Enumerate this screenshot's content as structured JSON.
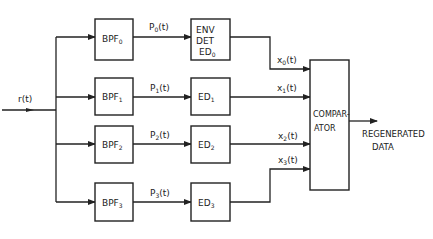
{
  "input": {
    "label": "r(t)"
  },
  "branches": [
    {
      "bpf": "BPF",
      "bpf_sub": "0",
      "signal": "P",
      "signal_sub": "0",
      "signal_arg": "(t)",
      "det_lines": [
        "ENV",
        "DET",
        "ED"
      ],
      "det_sub": "0",
      "out": "x",
      "out_sub": "0",
      "out_arg": "(t)"
    },
    {
      "bpf": "BPF",
      "bpf_sub": "1",
      "signal": "P",
      "signal_sub": "1",
      "signal_arg": "(t)",
      "det_lines": [
        "ED"
      ],
      "det_sub": "1",
      "out": "x",
      "out_sub": "1",
      "out_arg": "(t)"
    },
    {
      "bpf": "BPF",
      "bpf_sub": "2",
      "signal": "P",
      "signal_sub": "2",
      "signal_arg": "(t)",
      "det_lines": [
        "ED"
      ],
      "det_sub": "2",
      "out": "x",
      "out_sub": "2",
      "out_arg": "(t)"
    },
    {
      "bpf": "BPF",
      "bpf_sub": "3",
      "signal": "P",
      "signal_sub": "3",
      "signal_arg": "(t)",
      "det_lines": [
        "ED"
      ],
      "det_sub": "3",
      "out": "x",
      "out_sub": "3",
      "out_arg": "(t)"
    }
  ],
  "comparator": {
    "line1": "COMPAR-",
    "line2": "ATOR"
  },
  "output": {
    "line1": "REGENERATED",
    "line2": "DATA"
  }
}
